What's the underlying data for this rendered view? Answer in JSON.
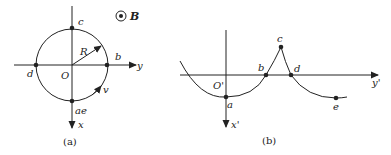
{
  "panel_a": {
    "caption": "(a)",
    "field_label": "B",
    "origin_label": "O",
    "radius_label": "R",
    "velocity_label": "v",
    "x_axis_label": "x",
    "y_axis_label": "y",
    "points": {
      "a_e": "ae",
      "b": "b",
      "c": "c",
      "d": "d"
    }
  },
  "panel_b": {
    "caption": "(b)",
    "origin_label": "O'",
    "x_axis_label": "x'",
    "y_axis_label": "y'",
    "points": {
      "a": "a",
      "b": "b",
      "c": "c",
      "d": "d",
      "e": "e"
    }
  },
  "colors": {
    "ink": "#222222",
    "background": "#ffffff"
  }
}
